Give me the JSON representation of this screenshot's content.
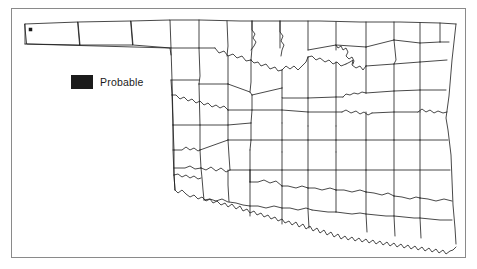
{
  "figure": {
    "type": "county-distribution-map",
    "region": "Oklahoma",
    "frame": {
      "border_color": "#8a8a8a"
    },
    "background_color": "#ffffff",
    "outline_color": "#1b1b1b"
  },
  "legend": {
    "swatch_icon": "filled-square-icon",
    "swatch_color": "#1b1b1b",
    "label": "Probable"
  },
  "markers": [
    {
      "name": "probable-marker",
      "county": "Cimarron",
      "x": 30.5,
      "y": 29.5,
      "color": "#1b1b1b"
    }
  ],
  "map_geometry": {
    "state_outline": "M24,24 L174,20 L190,20 L193,20 L440,23 L456,23 L448,120 L452,175 L451,212 L455,244 L446,247 L441,243 L436,245 L430,239 L423,241 L417,236 L410,238 L404,233 L397,236 L391,231 L384,234 L377,229 L371,233 L365,228 L358,231 L352,226 L345,230 L339,226 L333,230 L326,226 L320,231 L314,227 L308,232 L302,228 L296,233 L290,229 L284,234 L278,230 L272,235 L266,231 L260,236 L254,232 L248,230 L242,226 L236,228 L230,224 L224,226 L218,222 L212,218 L206,215 L200,211 L194,207 L189,203 L184,198 L179,193 L175,188 L172,183 L170,178 L169,50 L26,44 Z",
    "panhandle_dividers": [
      "M78,22 L79,45",
      "M130,21 L132,44"
    ],
    "vertical_grid_note": "county borders rendered as SVG paths"
  }
}
